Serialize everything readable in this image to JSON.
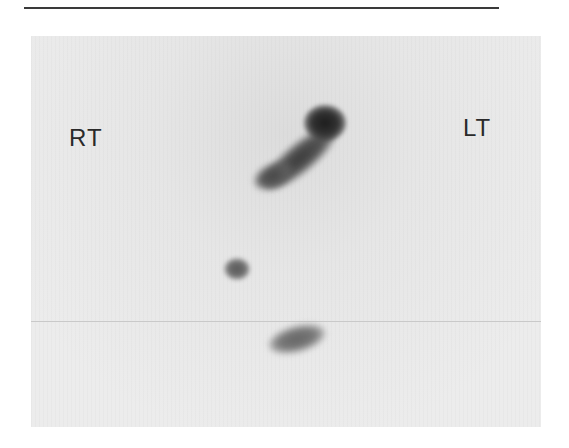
{
  "figure": {
    "type": "grayscale nuclear scintigraphy scan",
    "labels": {
      "right_side": "RT",
      "left_side": "LT"
    },
    "regions_of_uptake": [
      {
        "name": "upper curved uptake",
        "position": "upper center",
        "intensity": "high"
      },
      {
        "name": "small focal spot",
        "position": "left of center, middle",
        "intensity": "moderate"
      },
      {
        "name": "lower uptake",
        "position": "center, lower",
        "intensity": "moderate"
      }
    ]
  }
}
